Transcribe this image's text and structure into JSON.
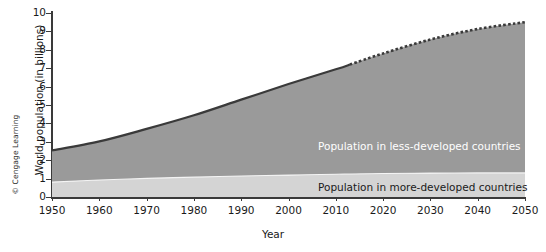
{
  "figure": {
    "credit": "© Cengage Learning"
  },
  "chart_data": {
    "type": "area",
    "title": "",
    "xlabel": "Year",
    "ylabel": "World population (in billions)",
    "xlim": [
      1950,
      2050
    ],
    "ylim": [
      0,
      10
    ],
    "grid": false,
    "legend_position": "inline-annotations",
    "xticks": [
      1950,
      1960,
      1970,
      1980,
      1990,
      2000,
      2010,
      2020,
      2030,
      2040,
      2050
    ],
    "yticks": [
      0,
      1,
      2,
      3,
      4,
      5,
      6,
      7,
      8,
      9,
      10
    ],
    "stacked": true,
    "projection_starts": 2013,
    "annotations": [
      {
        "text": "Population in less-developed countries",
        "color": "#ffffff"
      },
      {
        "text": "Population in more-developed countries",
        "color": "#1a1a1a"
      }
    ],
    "x": [
      1950,
      1960,
      1970,
      1980,
      1990,
      2000,
      2010,
      2013,
      2020,
      2030,
      2040,
      2050
    ],
    "series": [
      {
        "name": "Population in more-developed countries",
        "color": "#d4d4d4",
        "values": [
          0.81,
          0.92,
          1.01,
          1.08,
          1.14,
          1.19,
          1.24,
          1.25,
          1.28,
          1.3,
          1.31,
          1.31
        ]
      },
      {
        "name": "Population in less-developed countries",
        "color": "#9a9a9a",
        "values": [
          1.72,
          2.1,
          2.69,
          3.36,
          4.15,
          4.95,
          5.7,
          5.95,
          6.52,
          7.26,
          7.82,
          8.19
        ]
      }
    ],
    "total_values": [
      2.53,
      3.02,
      3.7,
      4.44,
      5.29,
      6.14,
      6.94,
      7.2,
      7.8,
      8.56,
      9.13,
      9.5
    ]
  },
  "axis": {
    "ytick_labels": [
      "10",
      "9",
      "8",
      "7",
      "6",
      "5",
      "4",
      "3",
      "2",
      "1",
      "0"
    ],
    "xtick_labels": [
      "1950",
      "1960",
      "1970",
      "1980",
      "1990",
      "2000",
      "2010",
      "2020",
      "2030",
      "2040",
      "2050"
    ]
  }
}
